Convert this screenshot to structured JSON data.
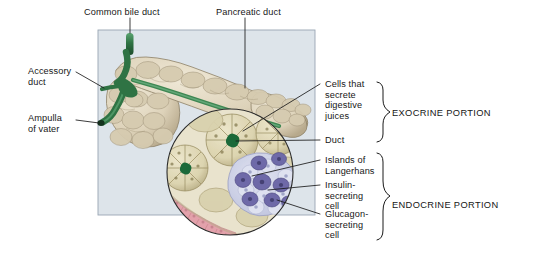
{
  "figure": {
    "background_color": "#ffffff",
    "panel_color": "#dde4ea",
    "panel_border_color": "#9aa6b4"
  },
  "labels": {
    "common_bile_duct": "Common bile duct",
    "pancreatic_duct": "Pancreatic duct",
    "accessory_duct": "Accessory\nduct",
    "ampulla_of_vater": "Ampulla\nof vater",
    "cells_secrete": "Cells that\nsecrete\ndigestive\njuices",
    "duct": "Duct",
    "islands_of_langerhans": "Islands of\nLangerhans",
    "insulin_cell": "Insulin-\nsecreting\ncell",
    "glucagon_cell": "Glucagon-\nsecreting\ncell"
  },
  "brackets": {
    "exocrine": "EXOCRINE PORTION",
    "endocrine": "ENDOCRINE PORTION"
  },
  "colors": {
    "duct_green": "#2d6b3f",
    "duct_green_light": "#4f9a63",
    "pancreas_tan": "#ded3bd",
    "pancreas_shadow": "#b9ab8d",
    "acinar_tan": "#ded7b6",
    "acinar_outline": "#9c9066",
    "lumen_green": "#1d6b3a",
    "islet_purple": "#6f6aa8",
    "islet_pale": "#ccd0e6",
    "epithelium_pink": "#e09aa4",
    "leader_line": "#1a1a1a"
  }
}
